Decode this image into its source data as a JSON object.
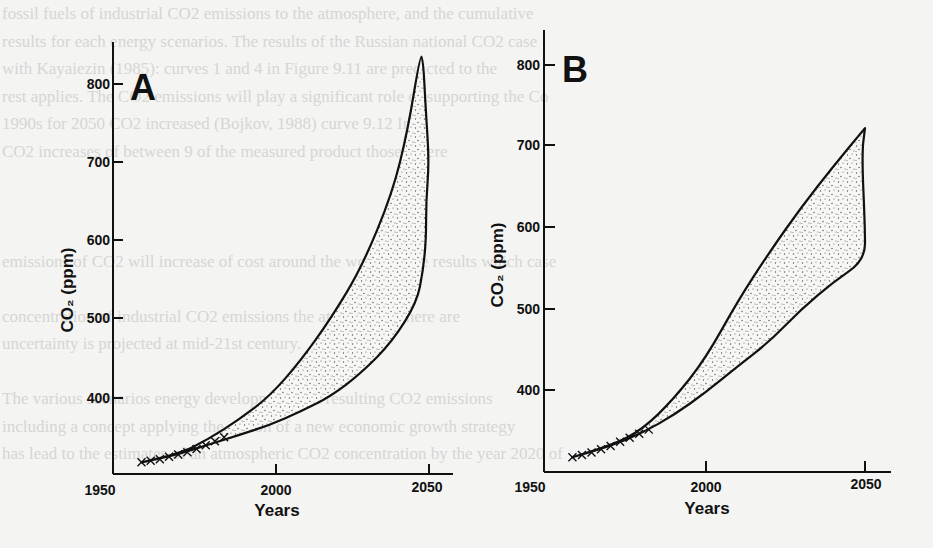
{
  "background_text": [
    "fossil fuels of industrial CO2 emissions to the atmosphere, and the cumulative",
    "results for each energy scenarios. The results of the Russian national CO2 case",
    "with Kayaiezin (1985): curves 1 and 4 in Figure 9.11 are predicted to the",
    "rest applies. The CO2 emissions will play a significant role of supporting the Co",
    "1990s for 2050 CO2 increased (Bojkov, 1988) curve 9.12 Inc",
    "CO2 increases of between 9 of the measured product those where",
    "",
    "",
    "",
    "emissions of CO2 will increase of cost around the world of the results which case",
    "",
    "concentration of industrial CO2 emissions the atmosphere there are",
    "uncertainty is projected at mid-21st century.",
    "",
    "The various scenarios energy development and resulting CO2 emissions",
    "including a concept applying the notion of a new economic growth strategy",
    "has lead to the estimates of an atmospheric CO2 concentration by the year 2020 of"
  ],
  "chart_data": [
    {
      "type": "area",
      "panel": "A",
      "title": "A",
      "xlabel": "Years",
      "ylabel": "CO2 (ppm)",
      "xlim": [
        1950,
        2058
      ],
      "ylim": [
        300,
        840
      ],
      "x_ticks": [
        1950,
        2000,
        2050
      ],
      "y_ticks": [
        400,
        500,
        600,
        700,
        800
      ],
      "grid": false,
      "legend": null,
      "observed_points": {
        "marker": "x",
        "x": [
          1958,
          1961,
          1964,
          1967,
          1970,
          1973,
          1976,
          1979,
          1982,
          1985
        ],
        "y": [
          315,
          317,
          319,
          322,
          325,
          328,
          332,
          337,
          342,
          347
        ]
      },
      "series": [
        {
          "name": "upper bound",
          "x": [
            1958,
            1970,
            1980,
            1990,
            2000,
            2010,
            2020,
            2030,
            2040,
            2045,
            2049
          ],
          "y": [
            315,
            325,
            345,
            370,
            400,
            445,
            500,
            565,
            660,
            740,
            835
          ]
        },
        {
          "name": "lower bound",
          "x": [
            1958,
            1970,
            1980,
            1990,
            2000,
            2010,
            2020,
            2030,
            2040,
            2048,
            2050,
            2051,
            2051,
            2052,
            2051,
            2050
          ],
          "y": [
            315,
            325,
            338,
            350,
            363,
            380,
            400,
            430,
            470,
            520,
            560,
            600,
            650,
            700,
            760,
            835
          ]
        }
      ]
    },
    {
      "type": "area",
      "panel": "B",
      "title": "B",
      "xlabel": "Years",
      "ylabel": "CO2 (ppm)",
      "xlim": [
        1950,
        2058
      ],
      "ylim": [
        300,
        840
      ],
      "x_ticks": [
        1950,
        2000,
        2050
      ],
      "y_ticks": [
        400,
        500,
        600,
        700,
        800
      ],
      "grid": false,
      "legend": null,
      "observed_points": {
        "marker": "x",
        "x": [
          1958,
          1961,
          1964,
          1967,
          1970,
          1973,
          1976,
          1979,
          1982
        ],
        "y": [
          318,
          321,
          324,
          328,
          332,
          337,
          342,
          347,
          352
        ]
      },
      "series": [
        {
          "name": "upper bound",
          "x": [
            1958,
            1970,
            1980,
            1990,
            2000,
            2010,
            2020,
            2030,
            2040,
            2050
          ],
          "y": [
            318,
            332,
            352,
            390,
            440,
            510,
            570,
            625,
            675,
            722
          ]
        },
        {
          "name": "lower bound",
          "x": [
            1958,
            1970,
            1980,
            1990,
            2000,
            2010,
            2020,
            2030,
            2040,
            2050,
            2050,
            2049,
            2050
          ],
          "y": [
            318,
            332,
            348,
            370,
            398,
            430,
            460,
            500,
            533,
            560,
            600,
            690,
            722
          ]
        }
      ]
    }
  ],
  "panels": {
    "a": {
      "label": "A",
      "ylabel": "CO₂ (ppm)",
      "xlabel": "Years",
      "y_tick_labels": [
        "800",
        "700",
        "600",
        "500",
        "400"
      ],
      "x_tick_labels": [
        "1950",
        "2000",
        "2050"
      ]
    },
    "b": {
      "label": "B",
      "ylabel": "CO₂ (ppm)",
      "xlabel": "Years",
      "y_tick_labels": [
        "800",
        "700",
        "600",
        "500",
        "400"
      ],
      "x_tick_labels": [
        "1950",
        "2000",
        "2050"
      ]
    }
  },
  "colors": {
    "ink": "#111111",
    "stipple": "#555555",
    "paper": "#f4f4f2",
    "bleed_text": "#d6d6d4"
  }
}
